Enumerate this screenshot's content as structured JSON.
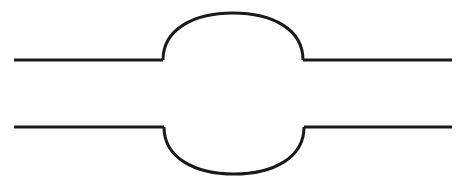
{
  "figure": {
    "title": "Two horizontal lines interrupted by opposing semicircular bulges",
    "background_color": "#ffffff",
    "stroke_color": "#1a1a1a",
    "stroke_width": 3,
    "canvas": {
      "width": 464,
      "height": 188
    }
  },
  "geometry": {
    "upper_line_y": 60,
    "lower_line_y": 127,
    "left_edge_x": 14,
    "right_edge_x": 452,
    "upper_arc": {
      "start_x": 163,
      "end_x": 303,
      "apex_x": 233,
      "apex_y": 13,
      "direction": "up"
    },
    "lower_arc": {
      "start_x": 164,
      "end_x": 304,
      "apex_x": 234,
      "apex_y": 174,
      "direction": "down"
    }
  },
  "paths": {
    "upper_left_segment": "M 14 60 L 163 60",
    "upper_arc": "M 163 60 C 163 29 194 13 233 13 C 272 13 303 29 303 60",
    "upper_right_segment": "M 303 60 L 452 60",
    "lower_left_segment": "M 14 127 L 164 127",
    "lower_arc": "M 164 127 C 164 158 195 174 234 174 C 273 174 304 158 304 127",
    "lower_right_segment": "M 304 127 L 452 127"
  }
}
